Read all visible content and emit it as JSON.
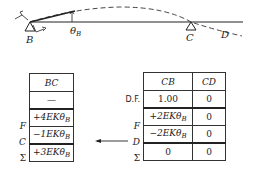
{
  "beam": {
    "supports": [
      {
        "label": "B",
        "x": 30
      },
      {
        "label": "C",
        "x": 191
      }
    ],
    "end_label": "D",
    "rotation_label": "θ",
    "rotation_subscript": "B"
  },
  "left_table": {
    "header": "BC",
    "df_value": "—",
    "rows": [
      {
        "label": "F",
        "value": "+4EKθ",
        "sub": "B"
      },
      {
        "label": "C",
        "value": "−1EKθ",
        "sub": "B"
      }
    ],
    "sum": {
      "label": "Σ",
      "value": "+3EKθ",
      "sub": "B"
    }
  },
  "right_table": {
    "headers": [
      "CB",
      "CD"
    ],
    "df": {
      "label": "D.F.",
      "values": [
        "1.00",
        "0"
      ]
    },
    "rows": [
      {
        "label": "F",
        "values": [
          "+2EKθ",
          "0"
        ],
        "sub": "B"
      },
      {
        "label": "D",
        "values": [
          "−2EKθ",
          "0"
        ],
        "sub": "B"
      }
    ],
    "sum": {
      "label": "Σ",
      "values": [
        "0",
        "0"
      ]
    }
  },
  "carryover_arrow": {
    "direction": "left"
  }
}
